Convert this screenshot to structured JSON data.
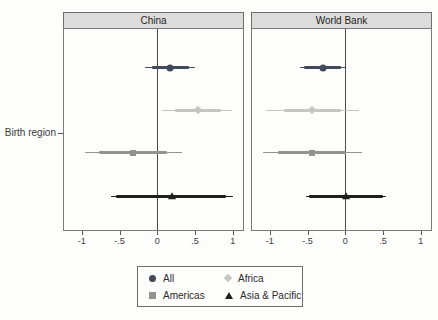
{
  "chart_data": {
    "type": "forest",
    "ylabel": "Birth region",
    "x_range": [
      -1.25,
      1.15
    ],
    "x_ticks": [
      -1,
      -0.5,
      0,
      0.5,
      1
    ],
    "x_tick_labels": [
      "-1",
      "-.5",
      "0",
      ".5",
      "1"
    ],
    "grid": false,
    "legend_position": "bottom",
    "series": [
      {
        "name": "All",
        "marker": "circle",
        "color": "#414a58"
      },
      {
        "name": "Africa",
        "marker": "diamond",
        "color": "#c3c7c1"
      },
      {
        "name": "Americas",
        "marker": "square",
        "color": "#8e948f"
      },
      {
        "name": "Asia & Pacific",
        "marker": "triangle",
        "color": "#1f1f1f"
      }
    ],
    "panels": [
      {
        "title": "China",
        "rows": [
          {
            "group": "All",
            "estimate": 0.17,
            "ci_inner": [
              -0.07,
              0.42
            ],
            "ci_outer": [
              -0.17,
              0.51
            ]
          },
          {
            "group": "Africa",
            "estimate": 0.54,
            "ci_inner": [
              0.24,
              0.85
            ],
            "ci_outer": [
              0.07,
              1.0
            ]
          },
          {
            "group": "Americas",
            "estimate": -0.32,
            "ci_inner": [
              -0.78,
              0.13
            ],
            "ci_outer": [
              -0.97,
              0.33
            ]
          },
          {
            "group": "Asia & Pacific",
            "estimate": 0.2,
            "ci_inner": [
              -0.55,
              0.92
            ],
            "ci_outer": [
              -0.62,
              1.02
            ]
          }
        ]
      },
      {
        "title": "World Bank",
        "rows": [
          {
            "group": "All",
            "estimate": -0.3,
            "ci_inner": [
              -0.55,
              -0.05
            ],
            "ci_outer": [
              -0.6,
              0.01
            ]
          },
          {
            "group": "Africa",
            "estimate": -0.44,
            "ci_inner": [
              -0.82,
              -0.06
            ],
            "ci_outer": [
              -1.06,
              0.18
            ]
          },
          {
            "group": "Americas",
            "estimate": -0.44,
            "ci_inner": [
              -0.9,
              0.01
            ],
            "ci_outer": [
              -1.1,
              0.22
            ]
          },
          {
            "group": "Asia & Pacific",
            "estimate": 0.01,
            "ci_inner": [
              -0.48,
              0.5
            ],
            "ci_outer": [
              -0.53,
              0.55
            ]
          }
        ]
      }
    ]
  }
}
